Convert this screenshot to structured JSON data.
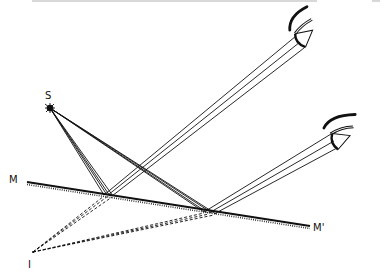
{
  "figure": {
    "header_text_clipped": "",
    "labels": {
      "source": "S",
      "mirror_left": "M",
      "mirror_right": "M'",
      "image": "I"
    },
    "points": {
      "source": [
        50,
        108
      ],
      "image": [
        33,
        252
      ],
      "mirror_start": [
        27,
        182
      ],
      "mirror_end": [
        310,
        226
      ],
      "reflection_1": [
        108,
        195
      ],
      "reflection_2": [
        210,
        213
      ],
      "eye_upper": [
        300,
        40
      ],
      "eye_lower": [
        335,
        140
      ]
    },
    "colors": {
      "ink": "#111111",
      "background": "#ffffff"
    }
  }
}
